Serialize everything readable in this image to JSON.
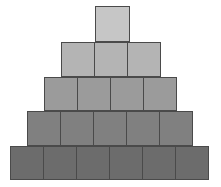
{
  "figure": {
    "background_color": "#ffffff",
    "width": 221,
    "height": 187,
    "border_color": "#4a4a4a",
    "total_blocks": 19,
    "row_count": 5
  },
  "chart_data": {
    "type": "bar",
    "xlabel": "",
    "ylabel": "",
    "categories": [
      "Row 1",
      "Row 2",
      "Row 3",
      "Row 4",
      "Row 5"
    ],
    "values": [
      1,
      3,
      4,
      5,
      6
    ],
    "ylim": [
      0,
      6
    ],
    "grid": false,
    "legend": "none"
  },
  "rows": [
    {
      "index": 1,
      "label": "row-1",
      "block_count": 1,
      "fill_color": "#c6c6c6",
      "left": 95,
      "top": 6,
      "block_width": 35,
      "block_height": 36
    },
    {
      "index": 2,
      "label": "row-2",
      "block_count": 3,
      "fill_color": "#b4b4b4",
      "left": 61,
      "top": 42,
      "block_width": 34,
      "block_height": 35
    },
    {
      "index": 3,
      "label": "row-3",
      "block_count": 4,
      "fill_color": "#9b9b9b",
      "left": 44,
      "top": 77,
      "block_width": 34,
      "block_height": 34
    },
    {
      "index": 4,
      "label": "row-4",
      "block_count": 5,
      "fill_color": "#808080",
      "left": 27,
      "top": 111,
      "block_width": 34,
      "block_height": 35
    },
    {
      "index": 5,
      "label": "row-5",
      "block_count": 6,
      "fill_color": "#6c6c6c",
      "left": 10,
      "top": 146,
      "block_width": 34,
      "block_height": 34
    }
  ]
}
